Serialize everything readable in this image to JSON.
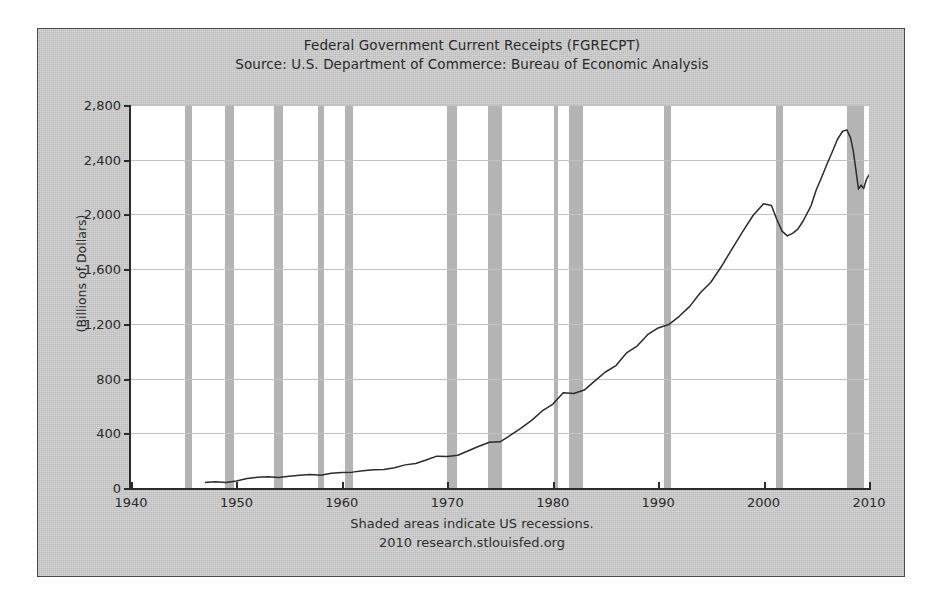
{
  "figure": {
    "title": "Federal Government Current Receipts (FGRECPT)",
    "subtitle": "Source: U.S. Department of Commerce: Bureau of Economic Analysis",
    "footnote": "Shaded areas indicate US recessions.",
    "credit": "2010 research.stlouisfed.org",
    "y_axis_title": "(Billions of Dollars)",
    "colors": {
      "panel_background": "#c9c9c9",
      "plot_background": "#ffffff",
      "recession_band": "#b4b4b4",
      "line": "#2b2b2b",
      "gridline": "#c2c2c2",
      "axis": "#2b2b2b",
      "text": "#2a2a2a"
    }
  },
  "chart_data": {
    "type": "line",
    "title": "Federal Government Current Receipts (FGRECPT)",
    "subtitle": "Source: U.S. Department of Commerce: Bureau of Economic Analysis",
    "xlabel": "",
    "ylabel": "(Billions of Dollars)",
    "xlim": [
      1940,
      2010
    ],
    "ylim": [
      0,
      2800
    ],
    "xticks": [
      1940,
      1950,
      1960,
      1970,
      1980,
      1990,
      2000,
      2010
    ],
    "xticklabels": [
      "1940",
      "1950",
      "1960",
      "1970",
      "1980",
      "1990",
      "2000",
      "2010"
    ],
    "yticks": [
      0,
      400,
      800,
      1200,
      1600,
      2000,
      2400,
      2800
    ],
    "yticklabels": [
      "0",
      "400",
      "800",
      "1,200",
      "1,600",
      "2,000",
      "2,400",
      "2,800"
    ],
    "grid": true,
    "legend": false,
    "annotation": "Shaded areas indicate US recessions.",
    "series": [
      {
        "name": "FGRECPT",
        "units": "Billions of Dollars",
        "x": [
          1947.0,
          1948.0,
          1949.0,
          1950.0,
          1951.0,
          1952.0,
          1953.0,
          1954.0,
          1955.0,
          1956.0,
          1957.0,
          1958.0,
          1959.0,
          1960.0,
          1961.0,
          1962.0,
          1963.0,
          1964.0,
          1965.0,
          1966.0,
          1967.0,
          1968.0,
          1969.0,
          1970.0,
          1971.0,
          1972.0,
          1973.0,
          1974.0,
          1975.0,
          1976.0,
          1977.0,
          1978.0,
          1979.0,
          1980.0,
          1981.0,
          1982.0,
          1983.0,
          1984.0,
          1985.0,
          1986.0,
          1987.0,
          1988.0,
          1989.0,
          1990.0,
          1991.0,
          1992.0,
          1993.0,
          1994.0,
          1995.0,
          1996.0,
          1997.0,
          1998.0,
          1999.0,
          2000.0,
          2000.75,
          2001.25,
          2001.75,
          2002.25,
          2002.75,
          2003.25,
          2003.75,
          2004.5,
          2005.0,
          2005.5,
          2006.0,
          2006.5,
          2007.0,
          2007.5,
          2007.9,
          2008.25,
          2008.5,
          2008.75,
          2009.0,
          2009.25,
          2009.5,
          2009.75,
          2010.0
        ],
        "y": [
          41,
          45,
          40,
          51,
          70,
          78,
          83,
          77,
          85,
          94,
          98,
          94,
          107,
          114,
          116,
          126,
          134,
          136,
          148,
          169,
          179,
          205,
          233,
          231,
          239,
          272,
          305,
          335,
          338,
          386,
          437,
          494,
          563,
          612,
          697,
          691,
          716,
          783,
          848,
          895,
          987,
          1038,
          1121,
          1170,
          1195,
          1255,
          1328,
          1428,
          1504,
          1619,
          1747,
          1872,
          1992,
          2078,
          2066,
          1965,
          1878,
          1843,
          1862,
          1892,
          1952,
          2063,
          2180,
          2270,
          2365,
          2455,
          2548,
          2608,
          2618,
          2560,
          2468,
          2330,
          2185,
          2214,
          2190,
          2255,
          2290
        ]
      }
    ],
    "recessions": [
      {
        "label": "1945",
        "start": 1945.15,
        "end": 1945.75
      },
      {
        "label": "1948-1949",
        "start": 1948.9,
        "end": 1949.8
      },
      {
        "label": "1953-1954",
        "start": 1953.6,
        "end": 1954.4
      },
      {
        "label": "1957-1958",
        "start": 1957.7,
        "end": 1958.3
      },
      {
        "label": "1960-1961",
        "start": 1960.3,
        "end": 1961.1
      },
      {
        "label": "1969-1970",
        "start": 1969.95,
        "end": 1970.9
      },
      {
        "label": "1973-1975",
        "start": 1973.9,
        "end": 1975.2
      },
      {
        "label": "1980",
        "start": 1980.1,
        "end": 1980.5
      },
      {
        "label": "1981-1982",
        "start": 1981.5,
        "end": 1982.9
      },
      {
        "label": "1990-1991",
        "start": 1990.6,
        "end": 1991.2
      },
      {
        "label": "2001",
        "start": 2001.2,
        "end": 2001.85
      },
      {
        "label": "2007-2009",
        "start": 2007.95,
        "end": 2009.5
      }
    ]
  }
}
